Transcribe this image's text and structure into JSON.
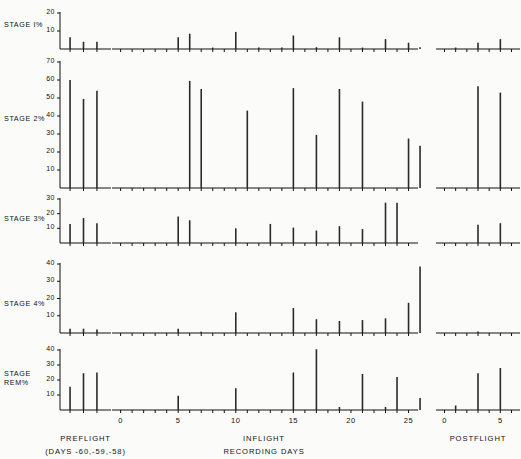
{
  "figure": {
    "xlabel_main": "RECORDING DAYS",
    "segments": [
      {
        "key": "preflight",
        "label": "PREFLIGHT",
        "sublabel": "(DAYS -60,-59,-58)",
        "days": [
          -60,
          -59,
          -58
        ]
      },
      {
        "key": "inflight",
        "label": "INFLIGHT",
        "sublabel": "",
        "ticks": [
          0,
          5,
          10,
          15,
          20,
          25
        ]
      },
      {
        "key": "postflight",
        "label": "POSTFLIGHT",
        "sublabel": "",
        "ticks": [
          0,
          5
        ]
      }
    ]
  },
  "chart_data": {
    "type": "bar",
    "title": "",
    "xlabel": "RECORDING DAYS",
    "ylabel": "",
    "grid": false,
    "legend": "none",
    "panels": [
      {
        "name": "stage1",
        "label": "STAGE  I%",
        "ylim": [
          0,
          20
        ],
        "yticks": [
          10,
          20
        ],
        "preflight": {
          "x": [
            -60,
            -59,
            -58
          ],
          "values": [
            6.5,
            4.0,
            4.0
          ]
        },
        "inflight": {
          "x": [
            5,
            6,
            8,
            10,
            12,
            14,
            15,
            17,
            19,
            21,
            23,
            25,
            26
          ],
          "values": [
            6.5,
            8.5,
            0.8,
            9.5,
            0.8,
            0.8,
            7.5,
            1.0,
            6.5,
            0.8,
            5.5,
            3.5,
            1.0
          ]
        },
        "postflight": {
          "x": [
            1,
            3,
            5,
            7
          ],
          "values": [
            0.8,
            3.5,
            5.5,
            4.0
          ]
        }
      },
      {
        "name": "stage2",
        "label": "STAGE  2%",
        "ylim": [
          0,
          70
        ],
        "yticks": [
          10,
          20,
          30,
          40,
          50,
          60,
          70
        ],
        "preflight": {
          "x": [
            -60,
            -59,
            -58
          ],
          "values": [
            60.0,
            49.5,
            54.0
          ]
        },
        "inflight": {
          "x": [
            6,
            7,
            11,
            15,
            17,
            19,
            21,
            23,
            25,
            26
          ],
          "values": [
            59.5,
            55.0,
            43.0,
            55.5,
            29.5,
            55.0,
            48.0,
            0.0,
            27.5,
            23.5
          ]
        },
        "postflight": {
          "x": [
            3,
            5,
            7
          ],
          "values": [
            56.5,
            53.0,
            56.5
          ]
        }
      },
      {
        "name": "stage3",
        "label": "STAGE  3%",
        "ylim": [
          0,
          30
        ],
        "yticks": [
          10,
          20,
          30
        ],
        "preflight": {
          "x": [
            -60,
            -59,
            -58
          ],
          "values": [
            13.0,
            17.0,
            13.5
          ]
        },
        "inflight": {
          "x": [
            5,
            6,
            10,
            13,
            15,
            17,
            19,
            21,
            23,
            24,
            26
          ],
          "values": [
            18.0,
            15.5,
            10.0,
            13.0,
            10.5,
            8.5,
            11.5,
            9.5,
            27.5,
            27.5,
            0.0
          ]
        },
        "postflight": {
          "x": [
            3,
            5,
            7
          ],
          "values": [
            12.5,
            13.5,
            14.0
          ]
        }
      },
      {
        "name": "stage4",
        "label": "STAGE  4%",
        "ylim": [
          0,
          40
        ],
        "yticks": [
          10,
          20,
          30,
          40
        ],
        "preflight": {
          "x": [
            -60,
            -59,
            -58
          ],
          "values": [
            2.5,
            2.5,
            2.0
          ]
        },
        "inflight": {
          "x": [
            5,
            7,
            10,
            13,
            15,
            17,
            19,
            21,
            23,
            25,
            26
          ],
          "values": [
            2.5,
            0.8,
            12.0,
            0.0,
            14.5,
            8.0,
            7.0,
            7.5,
            8.5,
            17.5,
            38.5
          ]
        },
        "postflight": {
          "x": [
            1,
            3,
            5,
            7
          ],
          "values": [
            0.0,
            0.8,
            0.0,
            1.5
          ]
        }
      },
      {
        "name": "stagerem",
        "label": "STAGE\nREM%",
        "ylim": [
          0,
          40
        ],
        "yticks": [
          10,
          20,
          30,
          40
        ],
        "preflight": {
          "x": [
            -60,
            -59,
            -58
          ],
          "values": [
            15.5,
            24.5,
            25.0
          ]
        },
        "inflight": {
          "x": [
            5,
            6,
            10,
            13,
            15,
            17,
            19,
            21,
            23,
            24,
            26
          ],
          "values": [
            9.5,
            0.0,
            14.5,
            0.0,
            25.0,
            40.5,
            2.0,
            24.0,
            2.0,
            22.0,
            8.0
          ]
        },
        "postflight": {
          "x": [
            1,
            3,
            5,
            7
          ],
          "values": [
            3.0,
            24.5,
            28.0,
            21.5
          ]
        }
      }
    ]
  }
}
